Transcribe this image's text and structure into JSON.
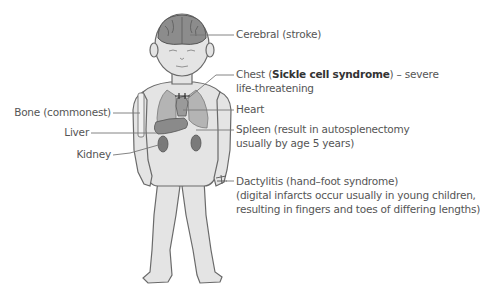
{
  "diagram": {
    "colors": {
      "skin": "#e4e4e4",
      "outline": "#6a6a6a",
      "organ": "#a8a8a8",
      "organ_dark": "#7a7a7a",
      "brain": "#8c8c8c",
      "leader_line": "#777777",
      "text": "#555555"
    },
    "labels_right": [
      {
        "id": "cerebral",
        "text": "Cerebral (stroke)"
      },
      {
        "id": "chest",
        "pre": "Chest (",
        "bold": "Sickle cell syndrome",
        "post": ") – severe",
        "line2": "life-threatening"
      },
      {
        "id": "heart",
        "text": "Heart"
      },
      {
        "id": "spleen",
        "text": "Spleen (result in autosplenectomy",
        "line2": "usually by age 5 years)"
      },
      {
        "id": "dactylitis",
        "text": "Dactylitis (hand–foot syndrome)",
        "line2": "(digital infarcts occur usually in young children,",
        "line3": "resulting in fingers and toes of differing lengths)"
      }
    ],
    "labels_left": [
      {
        "id": "bone",
        "text": "Bone (commonest)"
      },
      {
        "id": "liver",
        "text": "Liver"
      },
      {
        "id": "kidney",
        "text": "Kidney"
      }
    ]
  }
}
